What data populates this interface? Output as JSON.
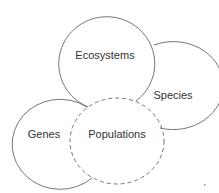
{
  "diagram": {
    "type": "overlapping-circles",
    "colors": {
      "stroke": "#666666",
      "text": "#333333",
      "background": "#ffffff"
    },
    "nodes": [
      {
        "id": "ecosystems",
        "label": "Ecosystems",
        "style": "solid"
      },
      {
        "id": "species",
        "label": "Species",
        "style": "solid"
      },
      {
        "id": "genes",
        "label": "Genes",
        "style": "solid"
      },
      {
        "id": "populations",
        "label": "Populations",
        "style": "dashed"
      }
    ]
  }
}
